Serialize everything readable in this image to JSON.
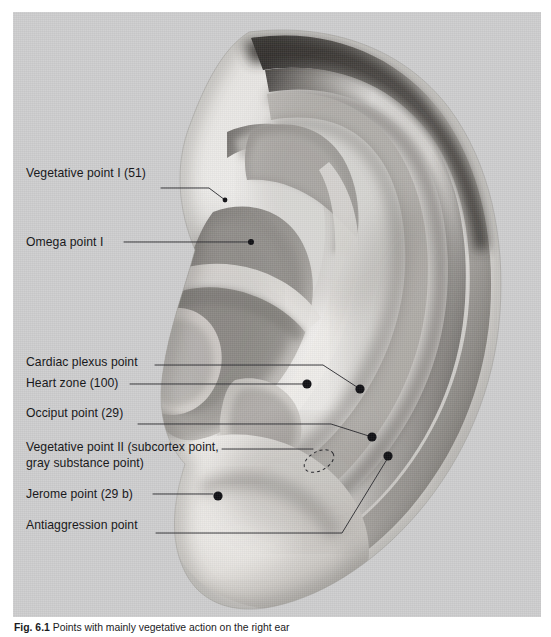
{
  "figure": {
    "panel_bg": "#cdcdce",
    "page_bg": "#ffffff",
    "label_color": "#19191b",
    "leader_color": "#2b2b2f",
    "marker_color": "#101014",
    "caption_prefix": "Fig. 6.1",
    "caption_text": "Points with mainly vegetative action on the right ear"
  },
  "labels": [
    {
      "id": "vegetative-point-1",
      "text": "Vegetative point I (51)"
    },
    {
      "id": "omega-point-1",
      "text": "Omega point I"
    },
    {
      "id": "cardiac-plexus",
      "text": "Cardiac plexus point"
    },
    {
      "id": "heart-zone",
      "text": "Heart zone (100)"
    },
    {
      "id": "occiput-point",
      "text": "Occiput point (29)"
    },
    {
      "id": "vegetative-point-2",
      "text": "Vegetative point II (subcortex point, gray substance point)"
    },
    {
      "id": "jerome-point",
      "text": "Jerome point (29 b)"
    },
    {
      "id": "antiaggression",
      "text": "Antiaggression point"
    }
  ],
  "markers": [
    {
      "id": "vegetative-point-1",
      "x": 225,
      "y": 200,
      "r": 2.4
    },
    {
      "id": "omega-point-1",
      "x": 251,
      "y": 242,
      "r": 3.0
    },
    {
      "id": "heart-zone",
      "x": 307,
      "y": 384,
      "r": 4.6
    },
    {
      "id": "cardiac-plexus",
      "x": 360,
      "y": 389,
      "r": 4.6
    },
    {
      "id": "occiput-point",
      "x": 372,
      "y": 437,
      "r": 4.6
    },
    {
      "id": "jerome-point",
      "x": 218,
      "y": 496,
      "r": 4.6
    },
    {
      "id": "antiaggression",
      "x": 388,
      "y": 456,
      "r": 4.6
    }
  ],
  "zones": [
    {
      "id": "vegetative-point-2-zone",
      "shape": "dashed-ellipse",
      "cx": 306,
      "cy": 449,
      "rx": 15,
      "ry": 9,
      "rotate": -28
    }
  ]
}
